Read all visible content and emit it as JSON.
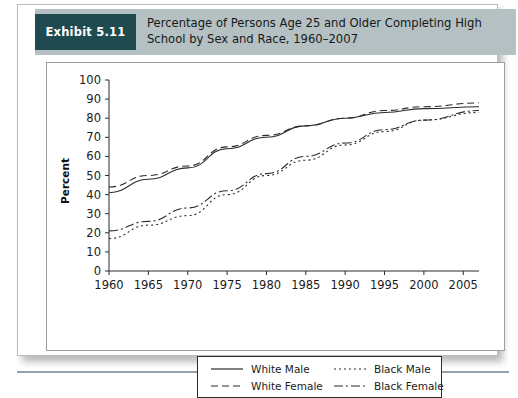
{
  "exhibit": {
    "badge_label": "Exhibit 5.11",
    "badge_color": "#1f4b50",
    "header_band_color": "#b4c0c2",
    "title": "Percentage of Persons Age 25 and Older Completing High School by Sex and Race, 1960–2007"
  },
  "chart_data": {
    "type": "line",
    "title": "Percentage of Persons Age 25 and Older Completing High School by Sex and Race, 1960–2007",
    "xlabel": "",
    "ylabel": "Percent",
    "xlim": [
      1960,
      2007
    ],
    "ylim": [
      0,
      100
    ],
    "grid": false,
    "legend_position": "bottom",
    "xticks": [
      1960,
      1965,
      1970,
      1975,
      1980,
      1985,
      1990,
      1995,
      2000,
      2005
    ],
    "xtick_labels": [
      "1960",
      "1965",
      "1970",
      "1975",
      "1980",
      "1985",
      "1990",
      "1995",
      "2000",
      "2005"
    ],
    "yticks": [
      0,
      10,
      20,
      30,
      40,
      50,
      60,
      70,
      80,
      90,
      100
    ],
    "ytick_labels": [
      "0",
      "10",
      "20",
      "30",
      "40",
      "50",
      "60",
      "70",
      "80",
      "90",
      "100"
    ],
    "x": [
      1960,
      1965,
      1970,
      1975,
      1980,
      1985,
      1990,
      1995,
      2000,
      2007
    ],
    "series": [
      {
        "name": "White Male",
        "line_style": "solid",
        "color": "#2b2b2b",
        "values": [
          41,
          48,
          54,
          64,
          70,
          76,
          80,
          83,
          85,
          86
        ]
      },
      {
        "name": "White Female",
        "line_style": "dashed",
        "color": "#2b2b2b",
        "values": [
          44,
          50,
          55,
          65,
          71,
          76,
          80,
          84,
          86,
          88
        ]
      },
      {
        "name": "Black Male",
        "line_style": "dotted",
        "color": "#2b2b2b",
        "values": [
          17,
          24,
          29,
          40,
          50,
          58,
          66,
          73,
          79,
          83
        ]
      },
      {
        "name": "Black Female",
        "line_style": "dashdot",
        "color": "#2b2b2b",
        "values": [
          21,
          26,
          33,
          42,
          51,
          60,
          67,
          74,
          79,
          84
        ]
      }
    ]
  },
  "legend": {
    "entries": [
      {
        "label": "White Male",
        "style": "solid"
      },
      {
        "label": "White Female",
        "style": "dashed"
      },
      {
        "label": "Black Male",
        "style": "dotted"
      },
      {
        "label": "Black Female",
        "style": "dashdot"
      }
    ]
  }
}
